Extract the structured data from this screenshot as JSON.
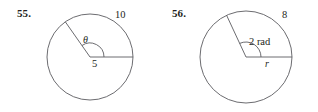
{
  "page": {
    "background_color": "#ffffff",
    "stroke_color": "#5b5b60",
    "text_color": "#231f20"
  },
  "figures": [
    {
      "number": "55.",
      "name": "circle-with-central-angle-theta",
      "circle": {
        "cx": 90,
        "cy": 57,
        "r": 43
      },
      "labels": {
        "arc_length": "10",
        "radius": "5",
        "angle": "θ"
      },
      "radii": [
        {
          "name": "horizontal-radius",
          "angle_deg": 0
        },
        {
          "name": "angled-radius",
          "angle_deg": 125
        }
      ],
      "angle_arc_radius": 14
    },
    {
      "number": "56.",
      "name": "circle-with-central-angle-2-rad",
      "circle": {
        "cx": 87,
        "cy": 57,
        "r": 46
      },
      "labels": {
        "arc_length": "8",
        "radius": "r",
        "angle": "2 rad"
      },
      "radii": [
        {
          "name": "horizontal-radius",
          "angle_deg": 0
        },
        {
          "name": "angled-radius",
          "angle_deg": 115
        }
      ],
      "angle_arc_radius": 15
    }
  ]
}
